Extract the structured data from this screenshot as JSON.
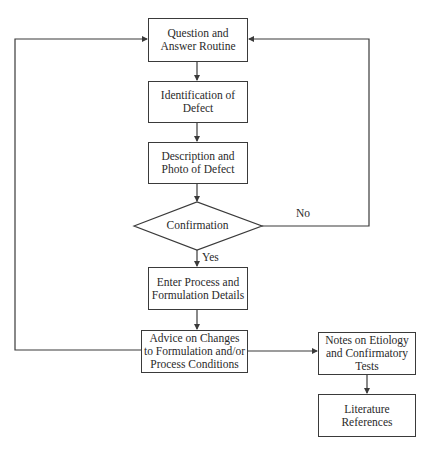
{
  "header": {
    "text": ""
  },
  "nodes": {
    "qa_routine": "Question and Answer Routine",
    "identification": "Identification of Defect",
    "description": "Description and Photo of Defect",
    "confirmation": "Confirmation",
    "enter_process": "Enter Process and Formulation Details",
    "advice": "Advice on Changes to Formulation and/or Process Conditions",
    "notes": "Notes on Etiology and Confirmatory Tests",
    "literature": "Literature References"
  },
  "edge_labels": {
    "no": "No",
    "yes": "Yes"
  },
  "colors": {
    "line": "#3a3a3a",
    "text": "#2a2a2a",
    "background": "#ffffff"
  }
}
